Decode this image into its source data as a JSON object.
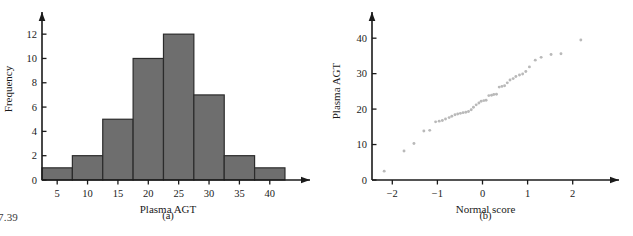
{
  "page": {
    "corner_number": "7.39",
    "panel_a_label": "(a)",
    "panel_b_label": "(b)",
    "bar_color": "#6e6e6e",
    "bar_edge_color": "#2b2b2b",
    "point_color": "#b9b9b9",
    "axis_color": "#1a1a1a",
    "background": "#ffffff"
  },
  "chart_data": [
    {
      "type": "bar",
      "panel": "(a)",
      "title": "",
      "xlabel": "Plasma AGT",
      "ylabel": "Frequency",
      "xlim": [
        2.5,
        43
      ],
      "ylim": [
        0,
        13
      ],
      "xticks": [
        5,
        10,
        15,
        20,
        25,
        30,
        35,
        40
      ],
      "yticks": [
        0,
        2,
        4,
        6,
        8,
        10,
        12
      ],
      "xtick_labels": [
        "5",
        "10",
        "15",
        "20",
        "25",
        "30",
        "35",
        "40"
      ],
      "ytick_labels": [
        "0",
        "2",
        "4",
        "6",
        "8",
        "10",
        "12"
      ],
      "grid": false,
      "legend": "none",
      "bin_width": 5,
      "bin_edges": [
        2.5,
        7.5,
        12.5,
        17.5,
        22.5,
        27.5,
        32.5,
        37.5,
        42.5
      ],
      "categories": [
        "2.5-7.5",
        "7.5-12.5",
        "12.5-17.5",
        "17.5-22.5",
        "22.5-27.5",
        "27.5-32.5",
        "32.5-37.5",
        "37.5-42.5"
      ],
      "values": [
        1,
        2,
        5,
        10,
        12,
        7,
        2,
        1
      ]
    },
    {
      "type": "scatter",
      "panel": "(b)",
      "title": "",
      "xlabel": "Normal score",
      "ylabel": "Plasma AGT",
      "xlim": [
        -2.45,
        2.45
      ],
      "ylim": [
        0,
        44
      ],
      "xticks": [
        -2,
        -1,
        0,
        1,
        2
      ],
      "yticks": [
        0,
        10,
        20,
        30,
        40
      ],
      "xtick_labels": [
        "−2",
        "−1",
        "0",
        "1",
        "2"
      ],
      "ytick_labels": [
        "0",
        "10",
        "20",
        "30",
        "40"
      ],
      "grid": false,
      "legend": "none",
      "x": [
        -2.18,
        -1.74,
        -1.52,
        -1.3,
        -1.17,
        -1.04,
        -0.96,
        -0.89,
        -0.82,
        -0.74,
        -0.68,
        -0.61,
        -0.55,
        -0.49,
        -0.43,
        -0.37,
        -0.31,
        -0.25,
        -0.2,
        -0.14,
        -0.08,
        -0.03,
        0.03,
        0.08,
        0.14,
        0.2,
        0.25,
        0.31,
        0.37,
        0.43,
        0.49,
        0.55,
        0.61,
        0.68,
        0.74,
        0.82,
        0.89,
        0.96,
        1.04,
        1.17,
        1.3,
        1.52,
        1.74,
        2.18
      ],
      "y": [
        2.5,
        8.2,
        10.3,
        13.8,
        14.0,
        16.4,
        16.6,
        16.8,
        17.2,
        17.6,
        18.0,
        18.4,
        18.6,
        18.8,
        19.0,
        19.1,
        19.3,
        19.8,
        20.5,
        21.2,
        21.7,
        22.2,
        22.4,
        22.5,
        23.8,
        23.9,
        24.1,
        24.2,
        26.2,
        26.4,
        26.6,
        27.4,
        28.2,
        28.6,
        29.2,
        29.6,
        29.9,
        30.6,
        31.9,
        33.8,
        34.6,
        35.4,
        35.6,
        39.5
      ]
    }
  ]
}
